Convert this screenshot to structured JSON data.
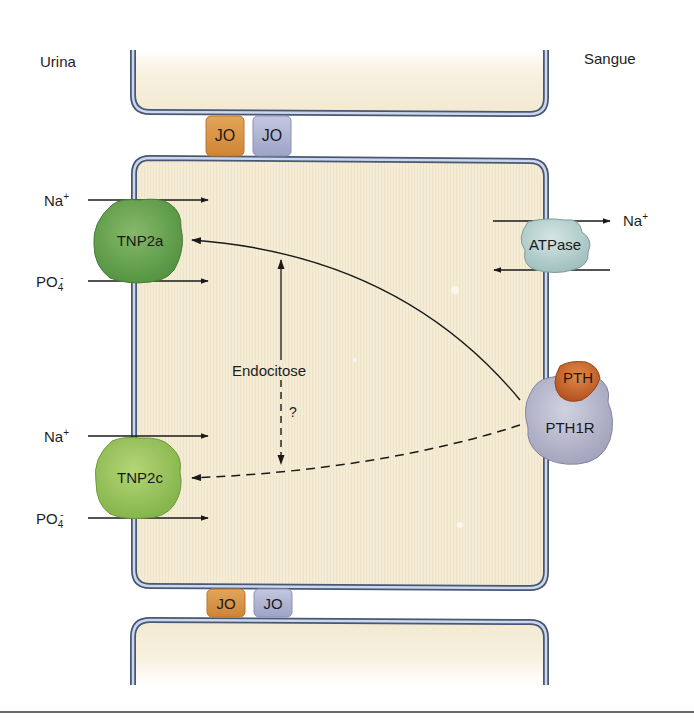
{
  "regions": {
    "left": "Urina",
    "right": "Sangue"
  },
  "junctions": {
    "top": [
      {
        "label": "JO",
        "color": "#d89442"
      },
      {
        "label": "JO",
        "color": "#a9aed0"
      }
    ],
    "bottom": [
      {
        "label": "JO",
        "color": "#d89442"
      },
      {
        "label": "JO",
        "color": "#a9aed0"
      }
    ]
  },
  "transporters": {
    "tnp2a": {
      "label": "TNP2a",
      "color": "#6aa851"
    },
    "tnp2c": {
      "label": "TNP2c",
      "color": "#9cc75a"
    },
    "atpase": {
      "label": "ATPase",
      "color": "#b4d0cf"
    },
    "pth1r": {
      "label": "PTH1R",
      "color": "#b5b6cc"
    },
    "pth": {
      "label": "PTH",
      "color": "#c9662a"
    }
  },
  "ions": {
    "na_base": "Na",
    "na_sup": "+",
    "po4_base": "PO",
    "po4_sub": "4",
    "po4_sup": "-"
  },
  "process": {
    "endocytosis": "Endocitose",
    "question": "?"
  },
  "colors": {
    "cell_fill": "#f5ecd6",
    "membrane_outer": "#4a5772",
    "membrane_inner": "#c9d8ef",
    "arrow": "#1a1a1a"
  }
}
